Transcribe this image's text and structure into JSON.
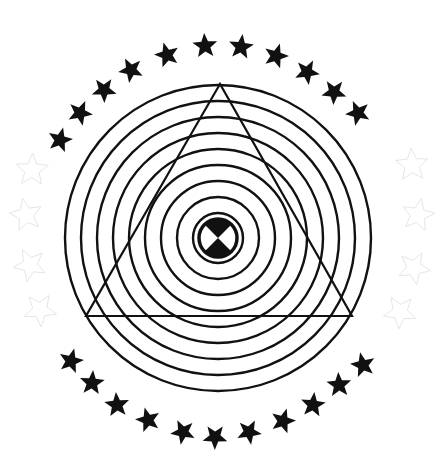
{
  "figure": {
    "title": "Concentric rings emblem with triangle and star border",
    "background": "#ffffff",
    "ink": "#111111",
    "faint_ink": "#e6e6e6",
    "center": [
      218,
      238
    ],
    "rings": {
      "count": 10,
      "radii": [
        25,
        41,
        57,
        73,
        89,
        105,
        121,
        137,
        153
      ],
      "stroke_width": 2.4
    },
    "core": {
      "radius": 19,
      "border": 3.5,
      "sectors": "top-and-bottom-black"
    },
    "triangle": {
      "apex": [
        220,
        84
      ],
      "base_left": [
        86,
        316
      ],
      "base_right": [
        352,
        316
      ],
      "stroke_width": 2.2
    },
    "stars": {
      "solid": [
        [
          60,
          140
        ],
        [
          80,
          113
        ],
        [
          104,
          90
        ],
        [
          131,
          70
        ],
        [
          167,
          55
        ],
        [
          205,
          46
        ],
        [
          241,
          47
        ],
        [
          276,
          56
        ],
        [
          307,
          72
        ],
        [
          334,
          92
        ],
        [
          358,
          113
        ],
        [
          71,
          361
        ],
        [
          92,
          383
        ],
        [
          117,
          405
        ],
        [
          148,
          420
        ],
        [
          183,
          432
        ],
        [
          215,
          437
        ],
        [
          249,
          432
        ],
        [
          283,
          421
        ],
        [
          313,
          405
        ],
        [
          339,
          385
        ],
        [
          363,
          365
        ]
      ],
      "faint": [
        [
          32,
          170
        ],
        [
          26,
          215
        ],
        [
          30,
          265
        ],
        [
          40,
          310
        ],
        [
          412,
          165
        ],
        [
          418,
          215
        ],
        [
          414,
          268
        ],
        [
          400,
          312
        ]
      ],
      "outer_radius": 13,
      "inner_radius": 5.6
    }
  }
}
